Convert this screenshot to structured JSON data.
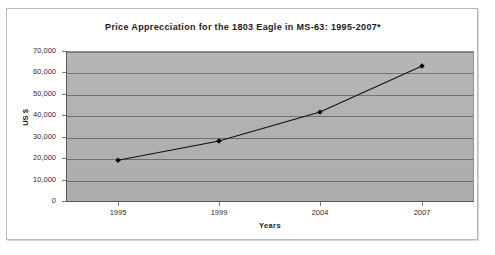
{
  "chart_data": {
    "type": "line",
    "title": "Price Apprecciation for the 1803 Eagle in MS-63: 1995-2007*",
    "xlabel": "Years",
    "ylabel": "US $",
    "categories": [
      "1995",
      "1999",
      "2004",
      "2007"
    ],
    "values": [
      19000,
      28000,
      41500,
      63000
    ],
    "series": [
      {
        "name": "Price",
        "values": [
          19000,
          28000,
          41500,
          63000
        ]
      }
    ],
    "ylim": [
      0,
      70000
    ],
    "y_ticks": [
      70000,
      60000,
      50000,
      40000,
      30000,
      20000,
      10000,
      0
    ],
    "y_tick_labels": [
      "70,000",
      "60,000",
      "50,000",
      "40,000",
      "30,000",
      "20,000",
      "10,000",
      "0"
    ],
    "x_tick_labels": [
      "1995",
      "1999",
      "2004",
      "2007"
    ],
    "grid": true,
    "grid_axis": "y",
    "legend": false,
    "legend_position": "none",
    "marker": "diamond",
    "colors": {
      "line": "#111111",
      "marker": "#000000",
      "plot_background": "#b2b2b2",
      "gridline": "#6f6f6f",
      "axis": "#5a5a5a",
      "chart_background": "#ffffff",
      "text": "#1a1a1a"
    },
    "annotations": [
      "*"
    ]
  }
}
